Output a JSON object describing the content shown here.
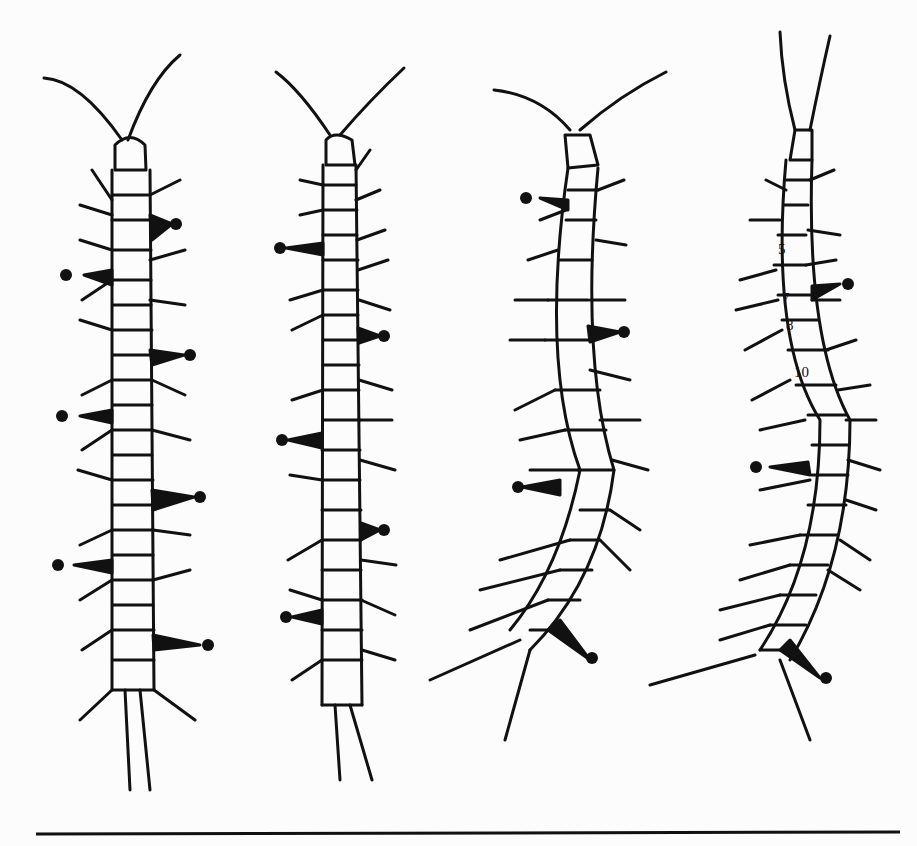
{
  "figure": {
    "colors": {
      "ink": "#111111",
      "paper": "#fcfcfc"
    },
    "specimens": [
      {
        "id": 1,
        "cx": 130,
        "dots": [
          [
            176,
            224
          ],
          [
            66,
            275
          ],
          [
            190,
            355
          ],
          [
            62,
            416
          ],
          [
            200,
            497
          ],
          [
            58,
            565
          ],
          [
            208,
            645
          ]
        ]
      },
      {
        "id": 2,
        "cx": 340,
        "dots": [
          [
            280,
            248
          ],
          [
            384,
            336
          ],
          [
            282,
            440
          ],
          [
            384,
            530
          ],
          [
            286,
            617
          ]
        ]
      },
      {
        "id": 3,
        "cx": 570,
        "dots": [
          [
            526,
            198
          ],
          [
            624,
            332
          ],
          [
            518,
            487
          ],
          [
            592,
            658
          ]
        ]
      },
      {
        "id": 4,
        "cx": 800,
        "dots": [
          [
            848,
            284
          ],
          [
            756,
            467
          ],
          [
            826,
            678
          ]
        ]
      }
    ],
    "segment_labels": [
      "5",
      "7",
      "8",
      "10"
    ]
  }
}
